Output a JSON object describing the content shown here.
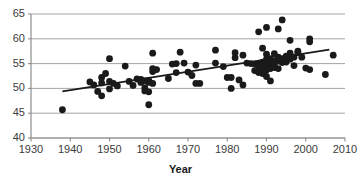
{
  "chart_data": {
    "type": "scatter",
    "title": "",
    "xlabel": "Year",
    "ylabel": "",
    "xlim": [
      1930,
      2010
    ],
    "ylim": [
      40,
      65
    ],
    "xticks": [
      1930,
      1940,
      1950,
      1960,
      1970,
      1980,
      1990,
      2000,
      2010
    ],
    "yticks": [
      40,
      45,
      50,
      55,
      60,
      65
    ],
    "grid": "horizontal",
    "legend": "none",
    "marker": {
      "shape": "circle",
      "color": "#1a1a1a",
      "size": 3.4
    },
    "trendline": {
      "type": "linear",
      "color": "#1a1a1a",
      "x_start": 1938,
      "y_start": 49.4,
      "x_end": 2006,
      "y_end": 57.8
    },
    "points": [
      [
        1938,
        45.7
      ],
      [
        1945,
        51.3
      ],
      [
        1946,
        50.7
      ],
      [
        1947,
        49.4
      ],
      [
        1948,
        52.2
      ],
      [
        1948,
        51.1
      ],
      [
        1948,
        48.5
      ],
      [
        1949,
        53.0
      ],
      [
        1950,
        56.0
      ],
      [
        1950,
        51.4
      ],
      [
        1950,
        49.9
      ],
      [
        1951,
        51.0
      ],
      [
        1952,
        50.5
      ],
      [
        1954,
        54.5
      ],
      [
        1955,
        51.4
      ],
      [
        1956,
        50.6
      ],
      [
        1957,
        51.9
      ],
      [
        1958,
        51.8
      ],
      [
        1958,
        51.2
      ],
      [
        1959,
        51.5
      ],
      [
        1959,
        50.1
      ],
      [
        1959,
        49.5
      ],
      [
        1960,
        51.6
      ],
      [
        1960,
        51.2
      ],
      [
        1960,
        49.3
      ],
      [
        1960,
        46.7
      ],
      [
        1961,
        57.1
      ],
      [
        1961,
        54.0
      ],
      [
        1961,
        53.4
      ],
      [
        1961,
        51.0
      ],
      [
        1962,
        53.8
      ],
      [
        1965,
        52.0
      ],
      [
        1966,
        54.9
      ],
      [
        1967,
        55.0
      ],
      [
        1967,
        53.2
      ],
      [
        1968,
        57.3
      ],
      [
        1969,
        55.1
      ],
      [
        1970,
        53.3
      ],
      [
        1971,
        52.6
      ],
      [
        1972,
        54.7
      ],
      [
        1972,
        51.0
      ],
      [
        1973,
        51.0
      ],
      [
        1977,
        57.7
      ],
      [
        1977,
        55.1
      ],
      [
        1979,
        54.4
      ],
      [
        1980,
        52.2
      ],
      [
        1981,
        52.2
      ],
      [
        1981,
        50.0
      ],
      [
        1982,
        57.2
      ],
      [
        1982,
        56.2
      ],
      [
        1983,
        51.7
      ],
      [
        1984,
        56.7
      ],
      [
        1984,
        50.7
      ],
      [
        1985,
        55.1
      ],
      [
        1986,
        55.0
      ],
      [
        1987,
        54.9
      ],
      [
        1987,
        53.6
      ],
      [
        1988,
        55.0
      ],
      [
        1988,
        54.4
      ],
      [
        1988,
        53.2
      ],
      [
        1988,
        61.4
      ],
      [
        1989,
        58.1
      ],
      [
        1989,
        55.3
      ],
      [
        1989,
        54.9
      ],
      [
        1989,
        54.3
      ],
      [
        1989,
        53.9
      ],
      [
        1989,
        53.0
      ],
      [
        1990,
        62.3
      ],
      [
        1990,
        56.9
      ],
      [
        1990,
        55.9
      ],
      [
        1990,
        55.1
      ],
      [
        1990,
        54.8
      ],
      [
        1990,
        54.3
      ],
      [
        1990,
        53.7
      ],
      [
        1990,
        52.4
      ],
      [
        1991,
        56.0
      ],
      [
        1991,
        55.4
      ],
      [
        1991,
        54.9
      ],
      [
        1991,
        54.4
      ],
      [
        1991,
        54.0
      ],
      [
        1991,
        51.5
      ],
      [
        1992,
        57.0
      ],
      [
        1992,
        55.4
      ],
      [
        1992,
        54.8
      ],
      [
        1992,
        54.2
      ],
      [
        1993,
        62.0
      ],
      [
        1993,
        56.3
      ],
      [
        1993,
        55.5
      ],
      [
        1993,
        54.0
      ],
      [
        1994,
        63.8
      ],
      [
        1994,
        56.0
      ],
      [
        1994,
        55.2
      ],
      [
        1995,
        56.5
      ],
      [
        1995,
        55.3
      ],
      [
        1996,
        59.7
      ],
      [
        1996,
        57.1
      ],
      [
        1996,
        55.9
      ],
      [
        1997,
        56.3
      ],
      [
        1997,
        54.6
      ],
      [
        1998,
        57.5
      ],
      [
        1998,
        57.2
      ],
      [
        1999,
        56.3
      ],
      [
        2000,
        54.1
      ],
      [
        2001,
        60.0
      ],
      [
        2001,
        59.4
      ],
      [
        2001,
        53.8
      ],
      [
        2005,
        52.8
      ],
      [
        2007,
        56.7
      ]
    ]
  },
  "axis": {
    "x_title": "Year",
    "x_tick_labels": [
      "1930",
      "1940",
      "1950",
      "1960",
      "1970",
      "1980",
      "1990",
      "2000",
      "2010"
    ],
    "y_tick_labels": [
      "65",
      "60",
      "55",
      "50",
      "45",
      "40"
    ]
  },
  "colors": {
    "marker": "#1a1a1a",
    "trendline": "#1a1a1a",
    "gridline": "#9a9a9a",
    "axis": "#8c8c8c",
    "tick_text": "#3b3b3b",
    "title_text": "#1a1a1a",
    "background": "#ffffff"
  }
}
